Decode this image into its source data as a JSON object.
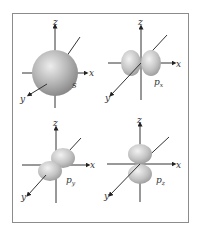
{
  "figure": {
    "panels": [
      {
        "orbital": "s",
        "label": "s",
        "axes": {
          "z": "z",
          "x": "x",
          "y": "y"
        }
      },
      {
        "orbital": "px",
        "label": "p",
        "sub": "x",
        "axes": {
          "z": "z",
          "x": "x",
          "y": "y"
        }
      },
      {
        "orbital": "py",
        "label": "p",
        "sub": "y",
        "axes": {
          "z": "z",
          "x": "x",
          "y": "y"
        }
      },
      {
        "orbital": "pz",
        "label": "p",
        "sub": "z",
        "axes": {
          "z": "z",
          "x": "x",
          "y": "y"
        }
      }
    ],
    "colors": {
      "border": "#8c8c8c",
      "axis": "#333333",
      "lobe_light": "#e4e4e4",
      "lobe_dark": "#8a8a8a"
    }
  }
}
